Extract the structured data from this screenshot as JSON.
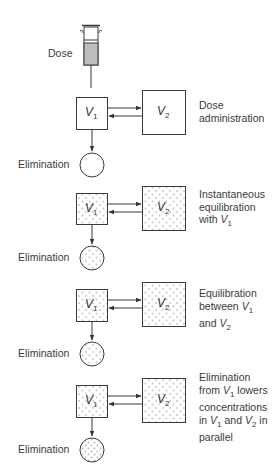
{
  "figure": {
    "dose_label": "Dose",
    "compartment_1": "V",
    "compartment_1_sub": "1",
    "compartment_2": "V",
    "compartment_2_sub": "2",
    "elimination_label": "Elimination",
    "colors": {
      "line": "#3a3a3a",
      "stipple": "#c8c8c8",
      "syringe_fill": "#bdbdbd"
    }
  },
  "panels": [
    {
      "stage": "dose",
      "description_lines": [
        "Dose",
        "administration"
      ],
      "elimination_label": "Elimination",
      "v1_filled": false,
      "v2_filled": false,
      "elim_filled": false
    },
    {
      "stage": "instantaneous",
      "description_lines": [
        "Instantaneous",
        "equilibration",
        "with "
      ],
      "desc_var": "V",
      "desc_sub": "1",
      "elimination_label": "Elimination",
      "v1_filled": true,
      "v2_filled": true,
      "elim_filled": true
    },
    {
      "stage": "equilibration",
      "description_lines": [
        "Equilibration",
        "between ",
        "and "
      ],
      "desc_var_a": "V",
      "desc_sub_a": "1",
      "desc_var_b": "V",
      "desc_sub_b": "2",
      "elimination_label": "Elimination",
      "v1_filled": true,
      "v2_filled": true,
      "elim_filled": true
    },
    {
      "stage": "elimination",
      "description_lines": [
        "Elimination",
        "from ",
        " lowers",
        "concentrations",
        "in ",
        " and ",
        " in",
        "parallel"
      ],
      "desc_var_a": "V",
      "desc_sub_a": "1",
      "desc_var_b": "V",
      "desc_sub_b": "2",
      "elimination_label": "Elimination",
      "v1_filled": true,
      "v2_filled": true,
      "elim_filled": true
    }
  ]
}
